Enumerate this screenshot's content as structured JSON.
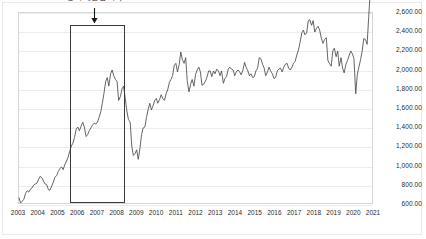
{
  "chart_data": {
    "type": "line",
    "title": "",
    "subtitle": "",
    "xlabel": "",
    "ylabel": "",
    "grid": true,
    "legend": false,
    "legend_position": "none",
    "line_color": "#4a4a4a",
    "xlim": [
      2003,
      2021
    ],
    "ylim": [
      600,
      2600
    ],
    "ytick_values": [
      2600,
      2400,
      2200,
      2000,
      1800,
      1600,
      1400,
      1200,
      1000,
      800,
      600
    ],
    "ytick_labels": [
      "2,600.00",
      "2,400.00",
      "2,200.00",
      "2,000.00",
      "1,800.00",
      "1,600.00",
      "1,400.00",
      "1,200.00",
      "1,000.00",
      "800.00",
      "600.00"
    ],
    "xtick_values": [
      2003,
      2004,
      2005,
      2006,
      2007,
      2008,
      2009,
      2010,
      2011,
      2012,
      2013,
      2014,
      2015,
      2016,
      2017,
      2018,
      2019,
      2020,
      2021
    ],
    "xtick_labels": [
      "2003",
      "2004",
      "2005",
      "2006",
      "2007",
      "2008",
      "2009",
      "2010",
      "2011",
      "2012",
      "2013",
      "2014",
      "2015",
      "2016",
      "2017",
      "2018",
      "2019",
      "2020",
      "2021"
    ],
    "annotations": [
      {
        "name": "level-up-period",
        "text": "증시 레벨업 시기",
        "type": "box-with-arrow",
        "x_start": 2005.6,
        "x_end": 2008.4,
        "y_bottom": 620,
        "y_top": 2480,
        "arrow_x": 2006.9,
        "box_color": "#3a3a3a"
      }
    ],
    "x": [
      2003.0,
      2003.08,
      2003.17,
      2003.25,
      2003.33,
      2003.42,
      2003.5,
      2003.58,
      2003.67,
      2003.75,
      2003.83,
      2003.92,
      2004.0,
      2004.08,
      2004.17,
      2004.25,
      2004.33,
      2004.42,
      2004.5,
      2004.58,
      2004.67,
      2004.75,
      2004.83,
      2004.92,
      2005.0,
      2005.08,
      2005.17,
      2005.25,
      2005.33,
      2005.42,
      2005.5,
      2005.58,
      2005.67,
      2005.75,
      2005.83,
      2005.92,
      2006.0,
      2006.08,
      2006.17,
      2006.25,
      2006.33,
      2006.42,
      2006.5,
      2006.58,
      2006.67,
      2006.75,
      2006.83,
      2006.92,
      2007.0,
      2007.08,
      2007.17,
      2007.25,
      2007.33,
      2007.42,
      2007.5,
      2007.58,
      2007.67,
      2007.75,
      2007.83,
      2007.92,
      2008.0,
      2008.08,
      2008.17,
      2008.25,
      2008.33,
      2008.42,
      2008.5,
      2008.58,
      2008.67,
      2008.75,
      2008.83,
      2008.92,
      2009.0,
      2009.08,
      2009.17,
      2009.25,
      2009.33,
      2009.42,
      2009.5,
      2009.58,
      2009.67,
      2009.75,
      2009.83,
      2009.92,
      2010.0,
      2010.08,
      2010.17,
      2010.25,
      2010.33,
      2010.42,
      2010.5,
      2010.58,
      2010.67,
      2010.75,
      2010.83,
      2010.92,
      2011.0,
      2011.08,
      2011.17,
      2011.25,
      2011.33,
      2011.42,
      2011.5,
      2011.58,
      2011.67,
      2011.75,
      2011.83,
      2011.92,
      2012.0,
      2012.08,
      2012.17,
      2012.25,
      2012.33,
      2012.42,
      2012.5,
      2012.58,
      2012.67,
      2012.75,
      2012.83,
      2012.92,
      2013.0,
      2013.08,
      2013.17,
      2013.25,
      2013.33,
      2013.42,
      2013.5,
      2013.58,
      2013.67,
      2013.75,
      2013.83,
      2013.92,
      2014.0,
      2014.08,
      2014.17,
      2014.25,
      2014.33,
      2014.42,
      2014.5,
      2014.58,
      2014.67,
      2014.75,
      2014.83,
      2014.92,
      2015.0,
      2015.08,
      2015.17,
      2015.25,
      2015.33,
      2015.42,
      2015.5,
      2015.58,
      2015.67,
      2015.75,
      2015.83,
      2015.92,
      2016.0,
      2016.08,
      2016.17,
      2016.25,
      2016.33,
      2016.42,
      2016.5,
      2016.58,
      2016.67,
      2016.75,
      2016.83,
      2016.92,
      2017.0,
      2017.08,
      2017.17,
      2017.25,
      2017.33,
      2017.42,
      2017.5,
      2017.58,
      2017.67,
      2017.75,
      2017.83,
      2017.92,
      2018.0,
      2018.08,
      2018.17,
      2018.25,
      2018.33,
      2018.42,
      2018.5,
      2018.58,
      2018.67,
      2018.75,
      2018.83,
      2018.92,
      2019.0,
      2019.08,
      2019.17,
      2019.25,
      2019.33,
      2019.42,
      2019.5,
      2019.58,
      2019.67,
      2019.75,
      2019.83,
      2019.92,
      2020.0,
      2020.08,
      2020.17,
      2020.25,
      2020.33,
      2020.42,
      2020.5,
      2020.58,
      2020.67,
      2020.75,
      2020.83,
      2020.92
    ],
    "y": [
      655,
      600,
      620,
      640,
      700,
      730,
      715,
      745,
      760,
      790,
      800,
      810,
      850,
      880,
      865,
      830,
      800,
      790,
      740,
      735,
      780,
      820,
      870,
      890,
      930,
      960,
      980,
      950,
      1000,
      1040,
      1080,
      1140,
      1200,
      1230,
      1290,
      1380,
      1400,
      1360,
      1410,
      1450,
      1400,
      1300,
      1320,
      1360,
      1390,
      1420,
      1440,
      1430,
      1450,
      1500,
      1560,
      1650,
      1750,
      1880,
      1920,
      1830,
      1960,
      2000,
      1940,
      1900,
      1880,
      1680,
      1720,
      1800,
      1830,
      1700,
      1570,
      1480,
      1450,
      1200,
      1100,
      1120,
      1160,
      1060,
      1180,
      1320,
      1390,
      1400,
      1500,
      1580,
      1650,
      1580,
      1620,
      1680,
      1700,
      1650,
      1690,
      1740,
      1700,
      1680,
      1750,
      1790,
      1870,
      1900,
      1940,
      2050,
      2070,
      1980,
      2060,
      2190,
      2110,
      2070,
      2130,
      1880,
      1770,
      1850,
      1900,
      1830,
      1950,
      2000,
      2030,
      1980,
      1840,
      1850,
      1880,
      1920,
      1990,
      1990,
      1930,
      1990,
      1960,
      2010,
      1990,
      1940,
      1990,
      1860,
      1910,
      1930,
      2010,
      2030,
      2010,
      2000,
      1940,
      1980,
      2000,
      1980,
      1950,
      2000,
      2080,
      2030,
      1990,
      1940,
      1960,
      1920,
      1930,
      1990,
      2020,
      2130,
      2120,
      2060,
      2020,
      1940,
      1980,
      2030,
      1990,
      1960,
      1910,
      1920,
      1990,
      2010,
      2020,
      1980,
      2030,
      2060,
      2070,
      2020,
      2000,
      2030,
      2070,
      2090,
      2160,
      2210,
      2290,
      2390,
      2420,
      2370,
      2390,
      2520,
      2530,
      2470,
      2520,
      2400,
      2440,
      2460,
      2420,
      2330,
      2280,
      2320,
      2340,
      2100,
      2070,
      2040,
      2200,
      2230,
      2140,
      2200,
      2040,
      2130,
      2020,
      1970,
      2060,
      2100,
      2150,
      2200,
      2170,
      2120,
      1750,
      1950,
      2030,
      2110,
      2200,
      2330,
      2320,
      2270,
      2550,
      2870
    ]
  }
}
